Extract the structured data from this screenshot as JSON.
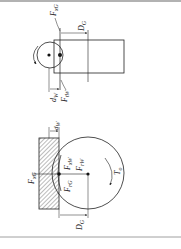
{
  "figure": {
    "top_view": {
      "labels": {
        "force_axial_grip": "F",
        "force_axial_grip_sub": "xG",
        "diameter_grip": "D",
        "diameter_grip_sub": "G",
        "offset_wheel": "d",
        "offset_wheel_sub": "W",
        "force_wheel": "F",
        "force_wheel_sub": "tW"
      }
    },
    "bottom_view": {
      "labels": {
        "offset_wheel": "d",
        "offset_wheel_sub": "W",
        "force_x_grip": "F",
        "force_x_grip_sub": "xG",
        "force_x_wheel": "F",
        "force_x_wheel_sub": "xW",
        "force_r_wheel": "F",
        "force_r_wheel_sub": "rW",
        "force_r_grip": "F",
        "force_r_grip_sub": "rG",
        "torque": "T",
        "torque_sub": "o",
        "diameter_grip": "D",
        "diameter_grip_sub": "G"
      }
    }
  },
  "colors": {
    "line": "#222222",
    "hatch": "#555555",
    "rule": "#888888"
  }
}
